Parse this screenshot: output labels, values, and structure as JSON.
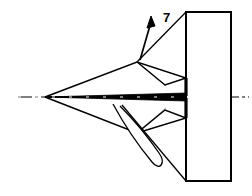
{
  "figure": {
    "kind": "technical-line-drawing",
    "width": 252,
    "height": 196,
    "background_color": "#ffffff",
    "line_color": "#000000",
    "thin_line_color": "#8a8a8a",
    "callouts": [
      {
        "id": "callout-7",
        "label": "7",
        "label_x": 163,
        "label_y": 22,
        "leader": "M 137 62 L 186 12",
        "arrow_shaft": "M 140 60 L 151 22",
        "arrow_tip": "M 151 16 L 147 28 L 155 26 Z"
      }
    ],
    "geometry": {
      "centerline": {
        "name": "axis-centerline",
        "x1": 18,
        "y1": 97,
        "x2": 249,
        "y2": 97,
        "dash": "14 3 3 3"
      },
      "tail_plate": {
        "name": "tail-plate-rectangle",
        "x": 186,
        "y": 12,
        "width": 45,
        "height": 169
      },
      "upper_wing": {
        "name": "upper-delta-wing",
        "path": "M 45 97 L 137 62 L 186 78 L 186 96 Z"
      },
      "lower_wing": {
        "name": "lower-delta-wing",
        "path": "M 45 97 L 137 133 L 186 118 L 186 98 Z"
      },
      "upper_wing_break": {
        "name": "upper-wing-fold-line",
        "path": "M 137 62 L 165 85 L 186 78"
      },
      "lower_wing_break": {
        "name": "lower-wing-fold-line",
        "path": "M 137 133 L 165 110 L 186 118"
      },
      "fuselage": {
        "name": "fuselage-body",
        "path": "M 45 97 L 186 93 L 186 101 Z"
      },
      "upper_root_edge": {
        "name": "upper-wing-root-edge",
        "path": "M 186 78 L 186 96"
      },
      "lower_root_edge": {
        "name": "lower-wing-root-edge",
        "path": "M 186 98 L 186 118"
      },
      "upper_thin_line": {
        "name": "upper-wing-crease-line",
        "path": "M 140 64 L 166 86"
      },
      "lower_thin_line": {
        "name": "lower-wing-crease-line",
        "path": "M 140 130 L 166 108"
      },
      "teardrop": {
        "name": "ventral-teardrop-fairing",
        "path": "M 113 104 C 126 128 142 150 152 162 C 160 172 166 163 159 153 C 148 137 132 118 120 106"
      },
      "teardrop_stroke": {
        "name": "ventral-fairing-strut",
        "path": "M 122 105 L 186 181"
      }
    }
  }
}
